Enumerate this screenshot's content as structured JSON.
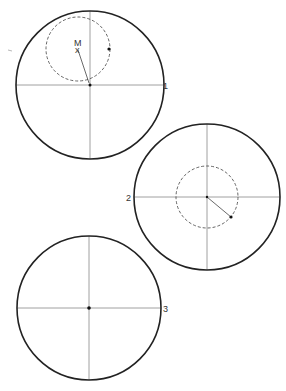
{
  "figure": {
    "colors": {
      "stroke": "#222222",
      "axis": "#888888",
      "dashed": "#555555",
      "dot": "#111111"
    },
    "speck": {
      "x": 10,
      "y": 50
    },
    "panels": [
      {
        "id": 1,
        "label": "1",
        "circle": {
          "cx": 90,
          "cy": 85,
          "r": 74
        },
        "label_pos": {
          "x": 163,
          "y": 89
        },
        "dashed_circle": {
          "cx": 78,
          "cy": 49,
          "r": 32
        },
        "center_dot": {
          "x": 90,
          "y": 85
        },
        "marker": {
          "label": "M",
          "x": 77,
          "y": 48,
          "symbol": "x"
        },
        "point": {
          "x": 109,
          "y": 49
        },
        "radius_line": {
          "x1": 78,
          "y1": 49,
          "x2": 89,
          "y2": 83
        }
      },
      {
        "id": 2,
        "label": "2",
        "circle": {
          "cx": 207,
          "cy": 197,
          "r": 73
        },
        "label_pos": {
          "x": 126,
          "y": 201
        },
        "dashed_circle": {
          "cx": 207,
          "cy": 197,
          "r": 31
        },
        "center_dot": {
          "x": 207,
          "y": 197
        },
        "point": {
          "x": 231,
          "y": 217
        },
        "radius_line": {
          "x1": 207,
          "y1": 197,
          "x2": 231,
          "y2": 217
        }
      },
      {
        "id": 3,
        "label": "3",
        "circle": {
          "cx": 89,
          "cy": 308,
          "r": 72
        },
        "label_pos": {
          "x": 163,
          "y": 312
        },
        "center_dot": {
          "x": 89,
          "y": 308
        }
      }
    ]
  }
}
